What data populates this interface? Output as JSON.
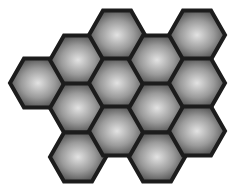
{
  "figure": {
    "hexagon_count": 13,
    "colors": {
      "background": "#ffffff",
      "stroke": "#1c1c1c",
      "fill_center": "#e2e2e2",
      "fill_mid": "#9a9a9a",
      "fill_edge": "#4a4a4a"
    },
    "hex": {
      "half_width": 28,
      "half_height": 24.5,
      "stroke_width": 4
    },
    "hexagons": [
      {
        "col": 0,
        "cx": 38,
        "cy": 83
      },
      {
        "col": 1,
        "cx": 78,
        "cy": 60
      },
      {
        "col": 1,
        "cx": 78,
        "cy": 108
      },
      {
        "col": 1,
        "cx": 78,
        "cy": 157
      },
      {
        "col": 2,
        "cx": 117,
        "cy": 35
      },
      {
        "col": 2,
        "cx": 117,
        "cy": 83
      },
      {
        "col": 2,
        "cx": 117,
        "cy": 131
      },
      {
        "col": 3,
        "cx": 157,
        "cy": 60
      },
      {
        "col": 3,
        "cx": 157,
        "cy": 108
      },
      {
        "col": 3,
        "cx": 157,
        "cy": 157
      },
      {
        "col": 4,
        "cx": 197,
        "cy": 35
      },
      {
        "col": 4,
        "cx": 197,
        "cy": 83
      },
      {
        "col": 4,
        "cx": 197,
        "cy": 131
      }
    ]
  }
}
